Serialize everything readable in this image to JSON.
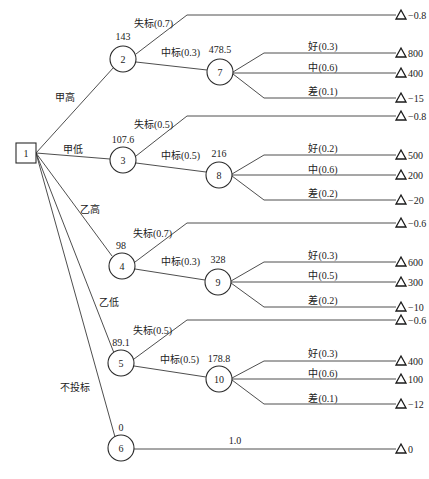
{
  "diagram": {
    "type": "decision-tree",
    "root": {
      "id": "1",
      "shape": "square"
    },
    "bid_options": [
      {
        "label": "甲高",
        "node": "2",
        "ev": "143",
        "lose": {
          "label": "失标(0.7)",
          "payoff": "−0.8"
        },
        "win": {
          "label": "中标(0.3)",
          "node": "7",
          "ev": "478.5",
          "outcomes": [
            {
              "label": "好(0.3)",
              "payoff": "800"
            },
            {
              "label": "中(0.6)",
              "payoff": "400"
            },
            {
              "label": "差(0.1)",
              "payoff": "−15"
            }
          ]
        }
      },
      {
        "label": "甲低",
        "node": "3",
        "ev": "107.6",
        "lose": {
          "label": "失标(0.5)",
          "payoff": "−0.8"
        },
        "win": {
          "label": "中标(0.5)",
          "node": "8",
          "ev": "216",
          "outcomes": [
            {
              "label": "好(0.2)",
              "payoff": "500"
            },
            {
              "label": "中(0.6)",
              "payoff": "200"
            },
            {
              "label": "差(0.2)",
              "payoff": "−20"
            }
          ]
        }
      },
      {
        "label": "乙高",
        "node": "4",
        "ev": "98",
        "lose": {
          "label": "失标(0.7)",
          "payoff": "−0.6"
        },
        "win": {
          "label": "中标(0.3)",
          "node": "9",
          "ev": "328",
          "outcomes": [
            {
              "label": "好(0.3)",
              "payoff": "600"
            },
            {
              "label": "中(0.5)",
              "payoff": "300"
            },
            {
              "label": "差(0.2)",
              "payoff": "−10"
            }
          ]
        }
      },
      {
        "label": "乙低",
        "node": "5",
        "ev": "89.1",
        "lose": {
          "label": "失标(0.5)",
          "payoff": "−0.6"
        },
        "win": {
          "label": "中标(0.5)",
          "node": "10",
          "ev": "178.8",
          "outcomes": [
            {
              "label": "好(0.3)",
              "payoff": "400"
            },
            {
              "label": "中(0.6)",
              "payoff": "100"
            },
            {
              "label": "差(0.1)",
              "payoff": "−12"
            }
          ]
        }
      },
      {
        "label": "不投标",
        "node": "6",
        "ev": "0",
        "direct": {
          "label": "1.0",
          "payoff": "0"
        }
      }
    ]
  }
}
